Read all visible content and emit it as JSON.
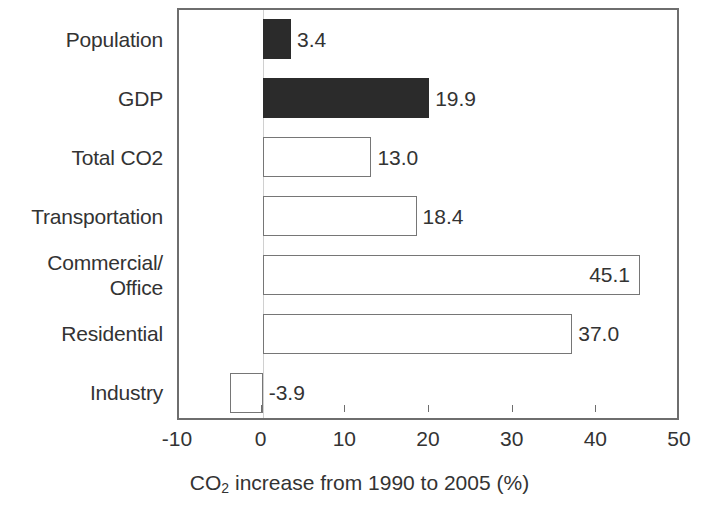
{
  "chart_data": {
    "type": "bar",
    "orientation": "horizontal",
    "title": "",
    "xlabel": "CO2 increase from 1990 to 2005 (%)",
    "xlabel_parts": {
      "pre": "CO",
      "sub": "2",
      "post": " increase from 1990 to 2005 (%)"
    },
    "ylabel": "",
    "xlim": [
      -10,
      50
    ],
    "xticks": [
      -10,
      0,
      10,
      20,
      30,
      40,
      50
    ],
    "xtick_labels": [
      "-10",
      "0",
      "10",
      "20",
      "30",
      "40",
      "50"
    ],
    "grid": false,
    "legend": false,
    "categories": [
      "Population",
      "GDP",
      "Total CO2",
      "Transportation",
      "Commercial/\nOffice",
      "Residential",
      "Industry"
    ],
    "values": [
      3.4,
      19.9,
      13.0,
      18.4,
      45.1,
      37.0,
      -3.9
    ],
    "value_labels": [
      "3.4",
      "19.9",
      "13.0",
      "18.4",
      "45.1",
      "37.0",
      "-3.9"
    ],
    "bar_styles": [
      "filled",
      "filled",
      "hollow",
      "hollow",
      "hollow",
      "hollow",
      "hollow"
    ],
    "label_placement": [
      "outside",
      "outside",
      "outside",
      "outside",
      "inside",
      "outside",
      "outside"
    ],
    "colors": {
      "filled": "#2b2b2b",
      "hollow_fill": "#ffffff",
      "hollow_border": "#767676",
      "axis": "#6e6e6e",
      "text": "#333333"
    }
  }
}
